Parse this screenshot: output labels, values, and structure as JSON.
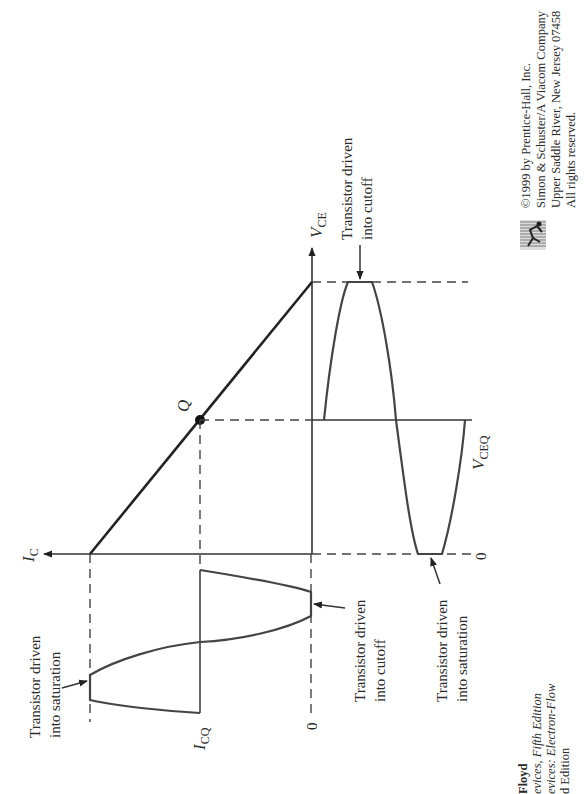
{
  "figure": {
    "orientation": "rotated-90-ccw",
    "axes": {
      "vertical_current_axis_label_main": "I",
      "vertical_current_axis_label_sub": "C",
      "horizontal_voltage_axis_label_main": "V",
      "horizontal_voltage_axis_label_sub": "CE"
    },
    "q_point_label": "Q",
    "ic_waveform": {
      "icq_label_main": "I",
      "icq_label_sub": "CQ",
      "zero_label": "0",
      "saturation_annotation": [
        "Transistor driven",
        "into saturation"
      ],
      "cutoff_annotation": [
        "Transistor driven",
        "into cutoff"
      ]
    },
    "vce_waveform": {
      "vceq_label_main": "V",
      "vceq_label_sub": "CEQ",
      "zero_label": "0",
      "cutoff_annotation": [
        "Transistor driven",
        "into cutoff"
      ],
      "saturation_annotation": [
        "Transistor driven",
        "into saturation"
      ]
    }
  },
  "copyright": {
    "lines": [
      "©1999 by Prentice-Hall, Inc.",
      "Simon & Schuster/A Viacom Company",
      "Upper Saddle River, New Jersey 07458",
      "All rights reserved."
    ],
    "logo_icon": "prentice-hall-runner-logo"
  },
  "book_credit": {
    "author_fragment": "Floyd",
    "lines": [
      "evices, Fifth Edition",
      "evices: Electron-Flow",
      "d Edition"
    ]
  },
  "colors": {
    "ink": "#2a2a2a",
    "background": "#ffffff"
  }
}
